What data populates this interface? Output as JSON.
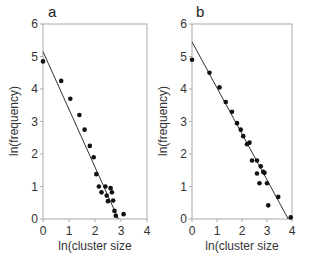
{
  "chart_data": [
    {
      "type": "scatter",
      "panel": "a",
      "title": "a",
      "xlabel": "ln(cluster size",
      "ylabel": "ln(frequency)",
      "xlim": [
        0,
        4
      ],
      "ylim": [
        0,
        6
      ],
      "xticks": [
        "0",
        "1",
        "2",
        "3",
        "4"
      ],
      "yticks": [
        "0",
        "1",
        "2",
        "3",
        "4",
        "5",
        "6"
      ],
      "grid": false,
      "points": [
        [
          0.0,
          4.85
        ],
        [
          0.7,
          4.25
        ],
        [
          1.05,
          3.7
        ],
        [
          1.4,
          3.2
        ],
        [
          1.6,
          2.75
        ],
        [
          1.8,
          2.25
        ],
        [
          1.95,
          1.9
        ],
        [
          2.05,
          1.38
        ],
        [
          2.15,
          1.0
        ],
        [
          2.25,
          0.82
        ],
        [
          2.4,
          1.0
        ],
        [
          2.45,
          0.72
        ],
        [
          2.5,
          0.55
        ],
        [
          2.6,
          0.95
        ],
        [
          2.65,
          0.82
        ],
        [
          2.7,
          0.57
        ],
        [
          2.75,
          0.25
        ],
        [
          2.8,
          0.1
        ],
        [
          3.1,
          0.15
        ]
      ],
      "fit_line": [
        [
          0.0,
          5.15
        ],
        [
          2.9,
          0.0
        ]
      ]
    },
    {
      "type": "scatter",
      "panel": "b",
      "title": "b",
      "xlabel": "ln(cluster size",
      "ylabel": "ln(frequency)",
      "xlim": [
        0,
        4
      ],
      "ylim": [
        0,
        6
      ],
      "xticks": [
        "0",
        "1",
        "2",
        "3",
        "4"
      ],
      "yticks": [
        "0",
        "1",
        "2",
        "3",
        "4",
        "5",
        "6"
      ],
      "grid": false,
      "points": [
        [
          0.0,
          4.9
        ],
        [
          0.7,
          4.5
        ],
        [
          1.1,
          4.05
        ],
        [
          1.35,
          3.6
        ],
        [
          1.6,
          3.3
        ],
        [
          1.8,
          2.95
        ],
        [
          1.95,
          2.75
        ],
        [
          2.05,
          2.55
        ],
        [
          2.2,
          2.3
        ],
        [
          2.3,
          2.35
        ],
        [
          2.4,
          1.8
        ],
        [
          2.6,
          1.8
        ],
        [
          2.6,
          1.4
        ],
        [
          2.7,
          1.1
        ],
        [
          2.75,
          1.62
        ],
        [
          2.85,
          1.45
        ],
        [
          2.9,
          1.42
        ],
        [
          3.0,
          1.1
        ],
        [
          3.05,
          0.42
        ],
        [
          3.45,
          0.68
        ],
        [
          3.95,
          0.05
        ]
      ],
      "fit_line": [
        [
          0.0,
          5.45
        ],
        [
          3.85,
          0.0
        ]
      ]
    }
  ],
  "colors": {
    "axis": "#aaaaaa",
    "point": "#111111",
    "line": "#333333",
    "text": "#333333"
  }
}
